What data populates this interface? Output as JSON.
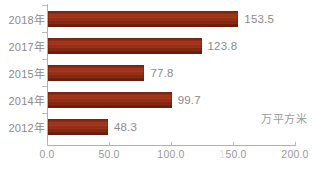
{
  "chart_data": {
    "type": "bar",
    "orientation": "horizontal",
    "title": "",
    "xlabel": "",
    "ylabel": "",
    "unit_label": "万平方米",
    "categories": [
      "2018年",
      "2017年",
      "2015年",
      "2014年",
      "2012年"
    ],
    "values": [
      153.5,
      123.8,
      77.8,
      99.7,
      48.3
    ],
    "value_labels": [
      "153.5",
      "123.8",
      "77.8",
      "99.7",
      "48.3"
    ],
    "xlim": [
      0,
      200
    ],
    "xticks": [
      0,
      50,
      100,
      150,
      200
    ],
    "xtick_labels": [
      "0.0",
      "50.0",
      "150.0",
      "150.0",
      "200.0"
    ],
    "grid": false,
    "legend": false,
    "bar_color": "#8e2a12",
    "text_color": "#8c8c8c",
    "axis_color": "#b0b0b0"
  },
  "axis": {
    "ticks": [
      {
        "value": 0,
        "label": "0.0"
      },
      {
        "value": 50,
        "label": "50.0"
      },
      {
        "value": 100,
        "label": "100.0"
      },
      {
        "value": 150,
        "label": "150.0"
      },
      {
        "value": 200,
        "label": "200.0"
      }
    ]
  },
  "unit": {
    "text": "万平方米"
  },
  "rows": [
    {
      "category": "2018年",
      "value": 153.5,
      "label": "153.5"
    },
    {
      "category": "2017年",
      "value": 123.8,
      "label": "123.8"
    },
    {
      "category": "2015年",
      "value": 77.8,
      "label": "77.8"
    },
    {
      "category": "2014年",
      "value": 99.7,
      "label": "99.7"
    },
    {
      "category": "2012年",
      "value": 48.3,
      "label": "48.3"
    }
  ]
}
